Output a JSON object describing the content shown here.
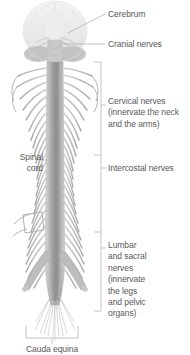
{
  "diagram": {
    "background_color": "#ffffff",
    "text_color": "#5a5a5a",
    "anatomy_color": "#b9b9b9",
    "leader_color": "#9a9a9a",
    "labels": {
      "cerebrum": "Cerebrum",
      "cranial_nerves": "Cranial nerves",
      "cervical_nerves": "Cervical nerves\n(innervate the neck\nand the arms)",
      "intercostal_nerves": "Intercostal nerves",
      "lumbar_sacral_nerves": "Lumbar\nand sacral\nnerves\n(innervate\nthe legs\nand pelvic\norgans)",
      "spinal_cord": "Spinal\ncord",
      "bottom_cutoff": "Cauda equina"
    },
    "structures": [
      "cerebrum",
      "cerebellum",
      "brainstem",
      "cranial-nerves",
      "spinal-cord",
      "cervical-nerve-roots",
      "intercostal-nerve-roots",
      "lumbar-sacral-nerve-roots",
      "cauda-equina"
    ],
    "brackets": [
      {
        "name": "cervical-bracket",
        "top": 62,
        "bottom": 155
      },
      {
        "name": "intercostal-bracket",
        "top": 155,
        "bottom": 232
      },
      {
        "name": "lumbar-sacral-bracket",
        "top": 232,
        "bottom": 311
      }
    ],
    "leaders": [
      {
        "name": "cerebrum-leader"
      },
      {
        "name": "cranial-nerves-leader"
      },
      {
        "name": "spinal-cord-leader"
      },
      {
        "name": "bottom-bracket"
      }
    ]
  }
}
